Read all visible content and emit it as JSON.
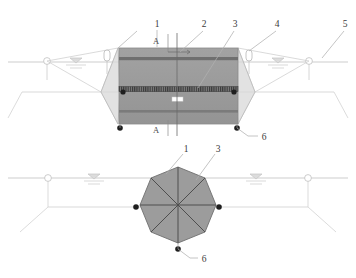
{
  "figure": {
    "title": "",
    "type": "engineering-diagram",
    "views": [
      {
        "name": "elevation-view",
        "section_marks": [
          "A",
          "A"
        ]
      },
      {
        "name": "plan-view",
        "section_marks": []
      }
    ]
  },
  "colors": {
    "cage_fill": "#9a9a9a",
    "cage_band": "#6d6d6d",
    "hatch_band": "#4a4a4a",
    "line": "#b9b9b9",
    "dark_line": "#5a5a5a",
    "anchor_dot": "#222222",
    "text": "#3a3a3a",
    "white": "#ffffff"
  },
  "callouts": {
    "top_view": [
      {
        "id": "c1",
        "text": "1",
        "x": 157,
        "y": 25
      },
      {
        "id": "c2",
        "text": "2",
        "x": 204,
        "y": 25
      },
      {
        "id": "c3",
        "text": "3",
        "x": 235,
        "y": 25
      },
      {
        "id": "c4",
        "text": "4",
        "x": 277,
        "y": 25
      },
      {
        "id": "c5",
        "text": "5",
        "x": 345,
        "y": 25
      },
      {
        "id": "c6",
        "text": "6",
        "x": 262,
        "y": 140
      }
    ],
    "bottom_view": [
      {
        "id": "b1",
        "text": "1",
        "x": 184,
        "y": 150
      },
      {
        "id": "b3",
        "text": "3",
        "x": 216,
        "y": 150
      },
      {
        "id": "b6",
        "text": "6",
        "x": 202,
        "y": 261
      }
    ],
    "section_marks": [
      {
        "id": "a-top",
        "text": "A",
        "x": 155,
        "y": 41
      },
      {
        "id": "a-bottom",
        "text": "A",
        "x": 155,
        "y": 130
      }
    ]
  },
  "legend_items": [
    {
      "number": "1",
      "name": "float-collar"
    },
    {
      "number": "2",
      "name": "net-cage-body"
    },
    {
      "number": "3",
      "name": "ballast-ring"
    },
    {
      "number": "4",
      "name": "marker-buoy"
    },
    {
      "number": "5",
      "name": "anchor-pile"
    },
    {
      "number": "6",
      "name": "anchor-block"
    }
  ],
  "icons": {
    "waterline": "water-surface-symbol",
    "buoy": "buoy-icon",
    "pile": "anchor-pile-icon",
    "anchor": "anchor-dot-icon"
  }
}
